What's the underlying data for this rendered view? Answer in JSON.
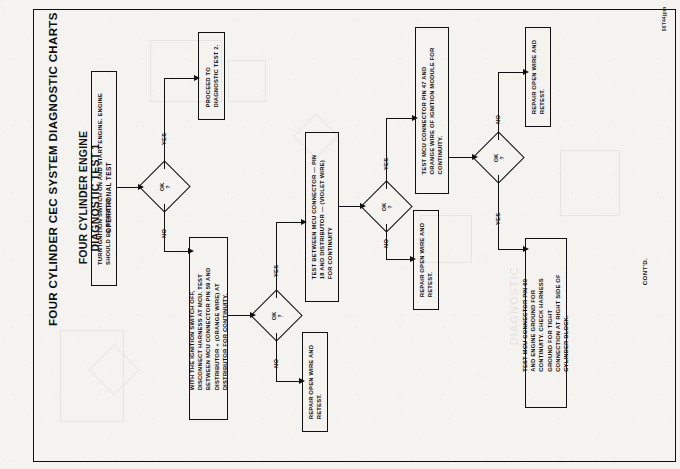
{
  "document": {
    "main_title": "FOUR CYLINDER CEC SYSTEM DIAGNOSTIC CHARTS",
    "heading_line_1": "FOUR CYLINDER ENGINE",
    "heading_line_2": "DIAGNOSTIC TEST 1",
    "heading_line_3": "OPERATIONAL TEST",
    "continued_label": "CONT'D.",
    "corner_code": "96T44jpm",
    "watermark": "DIAGNOSTIC"
  },
  "nodes": {
    "start_test": {
      "id": "start-test-box",
      "type": "process",
      "text": "TURN IGNITION SWITCH ON AND START ENGINE. ENGINE\nSHOULD BE STARTED"
    },
    "decision_1": {
      "id": "decision-ok-1",
      "type": "decision",
      "text": "OK\n?"
    },
    "proceed_test_2": {
      "id": "proceed-to-test-2-box",
      "type": "terminator",
      "text": "PROCEED TO\nDIAGNOSTIC TEST 2."
    },
    "test_pin_59": {
      "id": "test-pin-59-box",
      "type": "process",
      "text": "WITH THE IGNITION SWITCH OFF,\nDISCONNECT HARNESS AT MCU. TEST\nBETWEEN MCU CONNECTOR PIN 59 AND\nDISTRIBUTOR + (ORANGE WIRE) AT\nDISTRIBUTOR FOR CONTINUITY."
    },
    "decision_2": {
      "id": "decision-ok-2",
      "type": "decision",
      "text": "OK\n?"
    },
    "repair_1": {
      "id": "repair-open-wire-box-1",
      "type": "process",
      "text": "REPAIR OPEN WIRE AND\nRETEST."
    },
    "test_pin_18": {
      "id": "test-pin-18-box",
      "type": "process",
      "text": "TEST BETWEEN MCU CONNECTOR — PIN\n18 AND DISTRIBUTOR — (VIOLET WIRE)\nFOR CONTINUITY"
    },
    "decision_3": {
      "id": "decision-ok-3",
      "type": "decision",
      "text": "OK\n?"
    },
    "repair_2": {
      "id": "repair-open-wire-box-2",
      "type": "process",
      "text": "REPAIR OPEN WIRE AND\nRETEST."
    },
    "test_pin_47": {
      "id": "test-pin-47-box",
      "type": "process",
      "text": "TEST MCU CONNECTOR PIN 47 AND\nORANGE WIRE OF IGNITION MODULE FOR\nCONTINUITY."
    },
    "decision_4": {
      "id": "decision-ok-4",
      "type": "decision",
      "text": "OK\n?"
    },
    "repair_3": {
      "id": "repair-open-wire-box-3",
      "type": "process",
      "text": "REPAIR OPEN WIRE AND\nRETEST."
    },
    "test_pin_60": {
      "id": "test-pin-60-box",
      "type": "process",
      "text": "TEST MCU CONNECTOR PIN 60\nAND ENGINE GROUND FOR\nCONTINUITY. CHECK HARNESS\nGROUND FOR TIGHT\nCONNECTION AT RIGHT SIDE OF\nCYLINDER BLOCK."
    }
  },
  "branch_labels": {
    "d1_yes": "YES",
    "d1_no": "NO",
    "d2_yes": "YES",
    "d2_no": "NO",
    "d3_yes": "YES",
    "d3_no": "NO",
    "d4_no": "NO",
    "d4_yes": "YES"
  },
  "colors": {
    "ink": "#111111",
    "paper": "#f4f3f0"
  }
}
